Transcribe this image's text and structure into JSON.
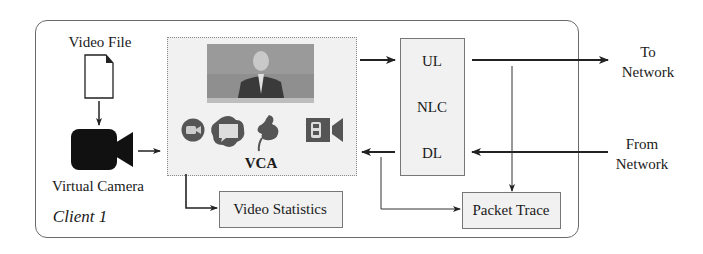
{
  "diagram": {
    "client_label": "Client 1",
    "video_file": {
      "label": "Video File",
      "icon": "file-icon"
    },
    "virtual_camera": {
      "label": "Virtual Camera",
      "icon": "video-camera-icon"
    },
    "vca": {
      "label": "VCA",
      "preview": "video-frame-speaker",
      "app_icons": [
        "zoom-icon",
        "webex-icon",
        "teams-icon",
        "meet-icon"
      ]
    },
    "video_statistics": {
      "label": "Video Statistics"
    },
    "nlc": {
      "label": "NLC",
      "uplink": "UL",
      "downlink": "DL"
    },
    "packet_trace": {
      "label": "Packet Trace"
    },
    "to_network": {
      "line1": "To",
      "line2": "Network"
    },
    "from_network": {
      "line1": "From",
      "line2": "Network"
    },
    "colors": {
      "box_fill": "#f1f1f1",
      "border": "#777777",
      "line": "#222222",
      "camera": "#111111"
    }
  }
}
